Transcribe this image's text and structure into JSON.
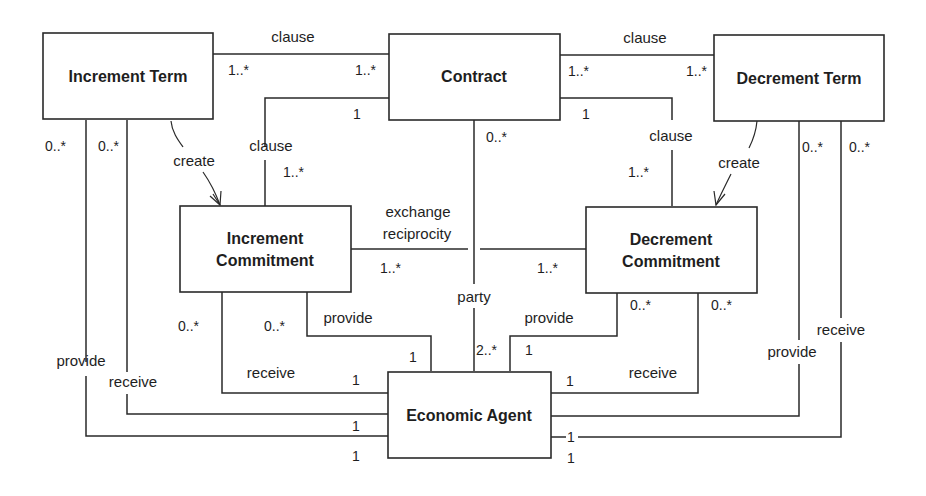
{
  "diagram": {
    "type": "UML class diagram",
    "classes": {
      "increment_term": "Increment Term",
      "contract": "Contract",
      "decrement_term": "Decrement Term",
      "increment_commitment_l1": "Increment",
      "increment_commitment_l2": "Commitment",
      "decrement_commitment_l1": "Decrement",
      "decrement_commitment_l2": "Commitment",
      "economic_agent": "Economic Agent"
    },
    "labels": {
      "clause_top_left": "clause",
      "clause_top_right": "clause",
      "clause_left": "clause",
      "clause_right": "clause",
      "create_left": "create",
      "create_right": "create",
      "exchange": "exchange",
      "reciprocity": "reciprocity",
      "party": "party",
      "provide_ic": "provide",
      "receive_ic": "receive",
      "provide_dc": "provide",
      "receive_dc": "receive",
      "provide_it": "provide",
      "receive_it": "receive",
      "provide_dt": "provide",
      "receive_dt": "receive"
    },
    "multiplicities": {
      "it_contract_it": "1..*",
      "it_contract_c": "1..*",
      "c_dt_c": "1..*",
      "c_dt_dt": "1..*",
      "c_ic_c": "1",
      "c_ic_ic": "1..*",
      "c_dc_c": "1",
      "c_dc_dc": "1..*",
      "c_party_c": "0..*",
      "party_ea": "2..*",
      "ic_dc_ic": "1..*",
      "ic_dc_dc": "1..*",
      "it_provide": "0..*",
      "it_receive": "0..*",
      "dt_receive": "0..*",
      "dt_provide": "0..*",
      "ic_receive": "0..*",
      "ic_provide": "0..*",
      "dc_provide": "0..*",
      "dc_receive": "0..*",
      "ea_ic_provide": "1",
      "ea_ic_receive": "1",
      "ea_dc_provide": "1",
      "ea_dc_receive": "1",
      "ea_it_receive": "1",
      "ea_it_provide": "1",
      "ea_dt_receive": "1",
      "ea_dt_provide": "1"
    }
  }
}
